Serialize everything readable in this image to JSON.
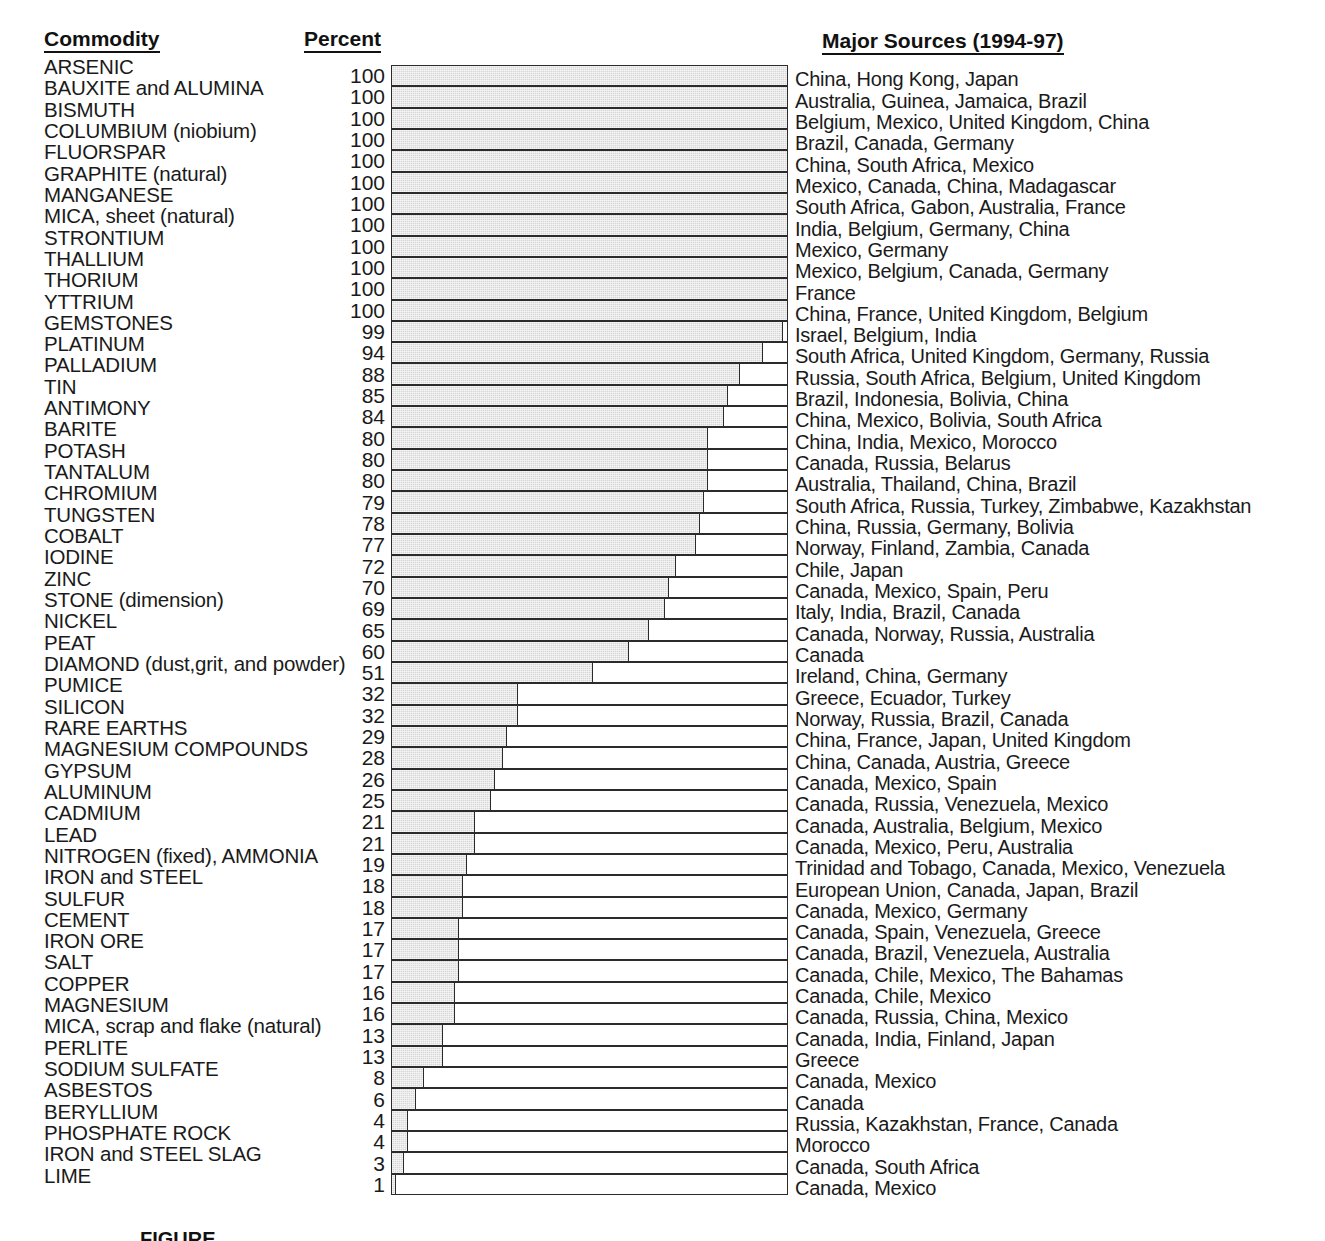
{
  "headers": {
    "commodity": "Commodity",
    "percent": "Percent",
    "sources": "Major Sources (1994-97)"
  },
  "figure_caption": "FIGURE",
  "colors": {
    "bar_fill": "#d7d7d7",
    "bar_outline": "#2b2b2b",
    "text": "#1a1a1a",
    "background": "#ffffff"
  },
  "chart_data": {
    "type": "bar",
    "orientation": "horizontal",
    "title": "",
    "xlabel": "Percent",
    "ylabel": "Commodity",
    "xlim": [
      0,
      100
    ],
    "grid": false,
    "legend": false,
    "categories": [
      "ARSENIC",
      "BAUXITE and ALUMINA",
      "BISMUTH",
      "COLUMBIUM (niobium)",
      "FLUORSPAR",
      "GRAPHITE (natural)",
      "MANGANESE",
      "MICA, sheet (natural)",
      "STRONTIUM",
      "THALLIUM",
      "THORIUM",
      "YTTRIUM",
      "GEMSTONES",
      "PLATINUM",
      "PALLADIUM",
      "TIN",
      "ANTIMONY",
      "BARITE",
      "POTASH",
      "TANTALUM",
      "CHROMIUM",
      "TUNGSTEN",
      "COBALT",
      "IODINE",
      "ZINC",
      "STONE (dimension)",
      "NICKEL",
      "PEAT",
      "DIAMOND (dust,grit, and powder)",
      "PUMICE",
      "SILICON",
      "RARE EARTHS",
      "MAGNESIUM COMPOUNDS",
      "GYPSUM",
      "ALUMINUM",
      "CADMIUM",
      "LEAD",
      "NITROGEN (fixed), AMMONIA",
      "IRON and STEEL",
      "SULFUR",
      "CEMENT",
      "IRON ORE",
      "SALT",
      "COPPER",
      "MAGNESIUM",
      "MICA, scrap and flake (natural)",
      "PERLITE",
      "SODIUM SULFATE",
      "ASBESTOS",
      "BERYLLIUM",
      "PHOSPHATE ROCK",
      "IRON and STEEL SLAG",
      "LIME"
    ],
    "values": [
      100,
      100,
      100,
      100,
      100,
      100,
      100,
      100,
      100,
      100,
      100,
      100,
      99,
      94,
      88,
      85,
      84,
      80,
      80,
      80,
      79,
      78,
      77,
      72,
      70,
      69,
      65,
      60,
      51,
      32,
      32,
      29,
      28,
      26,
      25,
      21,
      21,
      19,
      18,
      18,
      17,
      17,
      17,
      16,
      16,
      13,
      13,
      8,
      6,
      4,
      4,
      3,
      1
    ],
    "sources": [
      "China, Hong Kong, Japan",
      "Australia, Guinea, Jamaica, Brazil",
      "Belgium, Mexico, United Kingdom, China",
      "Brazil, Canada, Germany",
      "China, South Africa, Mexico",
      "Mexico, Canada, China, Madagascar",
      "South Africa, Gabon, Australia, France",
      "India, Belgium, Germany, China",
      "Mexico, Germany",
      "Mexico, Belgium, Canada, Germany",
      "France",
      "China, France, United Kingdom, Belgium",
      "Israel, Belgium, India",
      "South Africa, United Kingdom, Germany, Russia",
      "Russia, South Africa, Belgium, United Kingdom",
      "Brazil, Indonesia, Bolivia, China",
      "China, Mexico, Bolivia, South Africa",
      "China, India, Mexico, Morocco",
      "Canada, Russia, Belarus",
      "Australia, Thailand, China, Brazil",
      "South Africa, Russia, Turkey, Zimbabwe, Kazakhstan",
      "China, Russia, Germany, Bolivia",
      "Norway, Finland, Zambia, Canada",
      "Chile, Japan",
      "Canada, Mexico, Spain, Peru",
      "Italy, India, Brazil, Canada",
      "Canada, Norway, Russia, Australia",
      "Canada",
      "Ireland, China, Germany",
      "Greece, Ecuador, Turkey",
      "Norway, Russia, Brazil, Canada",
      "China, France, Japan, United Kingdom",
      "China, Canada, Austria, Greece",
      "Canada, Mexico, Spain",
      "Canada, Russia, Venezuela, Mexico",
      "Canada, Australia, Belgium, Mexico",
      "Canada, Mexico, Peru, Australia",
      "Trinidad and Tobago, Canada, Mexico, Venezuela",
      "European Union, Canada, Japan, Brazil",
      "Canada, Mexico, Germany",
      "Canada, Spain, Venezuela, Greece",
      "Canada, Brazil, Venezuela, Australia",
      "Canada, Chile, Mexico, The Bahamas",
      "Canada, Chile, Mexico",
      "Canada, Russia, China, Mexico",
      "Canada, India, Finland, Japan",
      "Greece",
      "Canada, Mexico",
      "Canada",
      "Russia, Kazakhstan, France, Canada",
      "Morocco",
      "Canada, South Africa",
      "Canada, Mexico"
    ]
  }
}
